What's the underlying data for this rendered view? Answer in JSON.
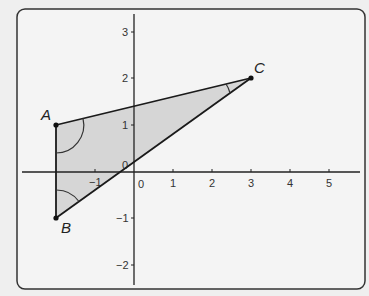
{
  "diagram": {
    "type": "coordinate-triangle",
    "frame": {
      "x": 17,
      "y": 9,
      "width": 348,
      "height": 280,
      "radius": 8,
      "stroke": "#333333",
      "fill": "#f4f4f4"
    },
    "axes": {
      "origin_px": [
        134,
        172
      ],
      "unit_x_px": 39,
      "unit_y_px": 46.7,
      "x_range": [
        -3,
        5.8
      ],
      "y_range": [
        -2.4,
        3.4
      ],
      "x_ticks": [
        -1,
        1,
        2,
        3,
        4,
        5
      ],
      "y_ticks": [
        -2,
        -1,
        1,
        2,
        3
      ],
      "x_tick_labels": [
        "-1",
        "0",
        "1",
        "2",
        "3",
        "4",
        "5"
      ],
      "y_tick_labels": [
        "3",
        "2",
        "1",
        "0",
        "-1",
        "-2"
      ],
      "origin_label_x": "0",
      "origin_label_y": "0"
    },
    "triangle": {
      "fill": "#d6d6d6",
      "stroke": "#1a1a1a",
      "vertices": [
        {
          "label": "A",
          "x": -2,
          "y": 1
        },
        {
          "label": "B",
          "x": -2,
          "y": -1
        },
        {
          "label": "C",
          "x": 3,
          "y": 2
        }
      ]
    },
    "angle_marks": [
      "A",
      "B",
      "C"
    ]
  },
  "labels": {
    "A": "A",
    "B": "B",
    "C": "C",
    "x_ticks": {
      "m1": "−1",
      "0": "0",
      "1": "1",
      "2": "2",
      "3": "3",
      "4": "4",
      "5": "5"
    },
    "y_ticks": {
      "3": "3",
      "2": "2",
      "1": "1",
      "0": "0",
      "m1": "−1",
      "m2": "−2"
    }
  }
}
